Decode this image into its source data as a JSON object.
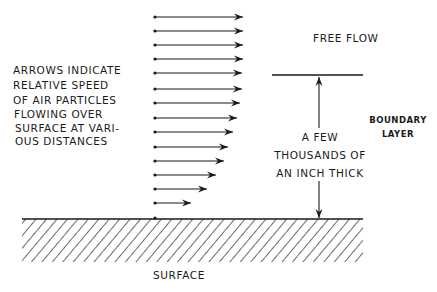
{
  "diagram": {
    "explanation_lines": [
      "ARROWS INDICATE",
      "RELATIVE SPEED",
      "OF AIR PARTICLES",
      "FLOWING OVER",
      "SURFACE AT VARI-",
      "OUS DISTANCES"
    ],
    "free_flow_label": "FREE FLOW",
    "boundary_layer_label": [
      "BOUNDARY",
      "LAYER"
    ],
    "thickness_label_lines": [
      "A FEW",
      "THOUSANDS OF",
      "AN INCH THICK"
    ],
    "surface_label": "SURFACE",
    "velocity_arrows": [
      {
        "y": 17,
        "x_end": 243
      },
      {
        "y": 31,
        "x_end": 243
      },
      {
        "y": 45,
        "x_end": 243
      },
      {
        "y": 59,
        "x_end": 243
      },
      {
        "y": 73,
        "x_end": 242
      },
      {
        "y": 89,
        "x_end": 242
      },
      {
        "y": 103,
        "x_end": 240
      },
      {
        "y": 118,
        "x_end": 237
      },
      {
        "y": 132,
        "x_end": 233
      },
      {
        "y": 147,
        "x_end": 228
      },
      {
        "y": 161,
        "x_end": 224
      },
      {
        "y": 175,
        "x_end": 216
      },
      {
        "y": 189,
        "x_end": 207
      },
      {
        "y": 203,
        "x_end": 191
      }
    ],
    "arrow_origin_x": 155,
    "surface_dot_y": 218,
    "colors": {
      "ink": "#1a1a1a",
      "background": "#ffffff"
    }
  }
}
